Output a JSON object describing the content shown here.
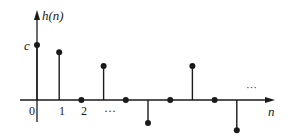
{
  "chart_data": {
    "type": "stem",
    "title": "",
    "xlabel": "n",
    "ylabel": "h(n)",
    "y_tick_labels": [
      "c"
    ],
    "x_tick_labels": [
      "0",
      "1",
      "2",
      "..."
    ],
    "annotations": [
      "...",
      "..."
    ],
    "x": [
      0,
      1,
      2,
      3,
      4,
      5,
      6,
      7,
      8,
      9
    ],
    "values": [
      1.0,
      0.87,
      0,
      0.62,
      0,
      -0.42,
      0,
      0.62,
      0,
      -0.55
    ],
    "value_notes": "h(0)=c; relative heights estimated from pixel positions",
    "grid": false,
    "legend": false,
    "color": "#1a1a1a"
  },
  "axes": {
    "y_label_func": "h",
    "y_label_arg": "(n)",
    "x_label": "n",
    "c_label": "c",
    "ellipsis_lower": "···",
    "ellipsis_upper": "···"
  }
}
